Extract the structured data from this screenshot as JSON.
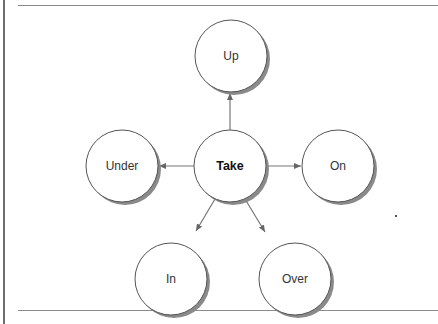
{
  "diagram": {
    "type": "hub-and-spoke",
    "center": {
      "id": "take",
      "label": "Take"
    },
    "nodes": [
      {
        "id": "up",
        "label": "Up"
      },
      {
        "id": "under",
        "label": "Under"
      },
      {
        "id": "on",
        "label": "On"
      },
      {
        "id": "in",
        "label": "In"
      },
      {
        "id": "over",
        "label": "Over"
      }
    ],
    "edges": [
      {
        "from": "take",
        "to": "up"
      },
      {
        "from": "take",
        "to": "under"
      },
      {
        "from": "take",
        "to": "on"
      },
      {
        "from": "take",
        "to": "in"
      },
      {
        "from": "take",
        "to": "over"
      }
    ],
    "colors": {
      "stroke": "#555555",
      "shadow": "#7a7a7a",
      "fill": "#ffffff",
      "arrow": "#666666"
    }
  }
}
